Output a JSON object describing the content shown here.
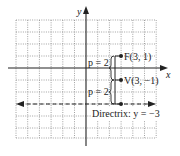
{
  "diagram": {
    "type": "parabola-focus-directrix",
    "axes": {
      "x_label": "x",
      "y_label": "y"
    },
    "grid": {
      "x_min": -6,
      "x_max": 6,
      "y_min": -6,
      "y_max": 4,
      "step": 1,
      "style": "dotted"
    },
    "points": [
      {
        "name": "F",
        "label": "F(3, 1)",
        "x": 3,
        "y": 1
      },
      {
        "name": "V",
        "label": "V(3, −1)",
        "x": 3,
        "y": -1
      },
      {
        "name": "D",
        "label": "",
        "x": 3,
        "y": -3
      }
    ],
    "braces": [
      {
        "label": "p = 2",
        "from": 1,
        "to": -1
      },
      {
        "label": "p = 2",
        "from": -1,
        "to": -3
      }
    ],
    "directrix": {
      "label": "Directrix:  y = −3",
      "y": -3,
      "style": "dashed",
      "arrows": "both"
    },
    "colors": {
      "ink": "#222222",
      "grid": "#888888",
      "background": "#ffffff"
    }
  }
}
